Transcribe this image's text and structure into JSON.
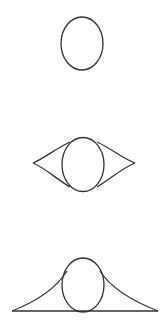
{
  "diagram": {
    "stroke_color": "#333333",
    "background": "#ffffff",
    "figures": [
      {
        "id": "ellipse-only",
        "ellipse": {
          "cx": 82,
          "cy": 43.5,
          "rx": 21,
          "ry": 26.5
        }
      },
      {
        "id": "ellipse-with-cusps",
        "ellipse": {
          "cx": 83,
          "cy": 164.5,
          "rx": 21,
          "ry": 27
        },
        "left_tip": [
          33,
          163
        ],
        "right_tip": [
          135,
          163
        ]
      },
      {
        "id": "ellipse-with-bell",
        "ellipse": {
          "cx": 83,
          "cy": 285,
          "rx": 21,
          "ry": 27
        },
        "baseline": {
          "x1": 12,
          "x2": 158,
          "y": 311
        }
      }
    ]
  }
}
